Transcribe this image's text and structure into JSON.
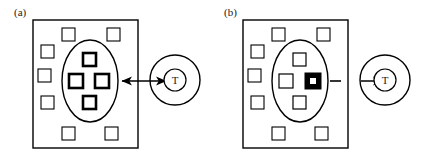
{
  "figure": {
    "type": "schematic-diagram",
    "background_color": "#ffffff",
    "stroke_color": "#000000",
    "fill_color": "#000000",
    "width": 432,
    "height": 163,
    "panels": [
      {
        "id": "a",
        "label": "(a)",
        "label_x": 14,
        "label_y": 16,
        "container": {
          "shape": "rectangle",
          "x": 33,
          "y": 20,
          "width": 105,
          "height": 128,
          "stroke_width": 1.4
        },
        "ellipse": {
          "shape": "ellipse",
          "cx": 90,
          "cy": 81,
          "rx": 28,
          "ry": 41,
          "stroke_width": 1.4
        },
        "outer_squares": [
          {
            "x": 62,
            "y": 28,
            "size": 13
          },
          {
            "x": 107,
            "y": 28,
            "size": 13
          },
          {
            "x": 41,
            "y": 45,
            "size": 13
          },
          {
            "x": 38,
            "y": 69,
            "size": 13
          },
          {
            "x": 41,
            "y": 96,
            "size": 13
          },
          {
            "x": 62,
            "y": 127,
            "size": 13
          },
          {
            "x": 105,
            "y": 127,
            "size": 13
          }
        ],
        "inner_squares": [
          {
            "x": 83,
            "y": 53,
            "size": 13,
            "style": "bold",
            "id": "top"
          },
          {
            "x": 69,
            "y": 74,
            "size": 14,
            "style": "bold",
            "id": "left"
          },
          {
            "x": 95,
            "y": 74,
            "size": 14,
            "style": "bold",
            "id": "right"
          },
          {
            "x": 83,
            "y": 96,
            "size": 13,
            "style": "bold",
            "id": "bottom"
          }
        ],
        "connector": {
          "style": "double-headed-arrow",
          "x1": 120,
          "x2": 168,
          "y": 81
        },
        "node": {
          "shape": "double-circle",
          "cx": 175,
          "cy": 80,
          "outer_r": 25,
          "inner_r": 11,
          "label": "T"
        }
      },
      {
        "id": "b",
        "label": "(b)",
        "label_x": 224,
        "label_y": 16,
        "container": {
          "shape": "rectangle",
          "x": 243,
          "y": 20,
          "width": 105,
          "height": 128,
          "stroke_width": 1.4
        },
        "ellipse": {
          "shape": "ellipse",
          "cx": 300,
          "cy": 81,
          "rx": 28,
          "ry": 41,
          "stroke_width": 1.4
        },
        "outer_squares": [
          {
            "x": 272,
            "y": 28,
            "size": 13
          },
          {
            "x": 317,
            "y": 28,
            "size": 13
          },
          {
            "x": 251,
            "y": 45,
            "size": 13
          },
          {
            "x": 248,
            "y": 69,
            "size": 13
          },
          {
            "x": 251,
            "y": 96,
            "size": 13
          },
          {
            "x": 272,
            "y": 127,
            "size": 13
          },
          {
            "x": 315,
            "y": 127,
            "size": 13
          }
        ],
        "inner_squares": [
          {
            "x": 293,
            "y": 53,
            "size": 13,
            "style": "thin",
            "id": "top"
          },
          {
            "x": 279,
            "y": 74,
            "size": 14,
            "style": "thin",
            "id": "left"
          },
          {
            "x": 293,
            "y": 96,
            "size": 13,
            "style": "thin",
            "id": "bottom"
          }
        ],
        "highlighted_square": {
          "x": 305,
          "y": 73,
          "size": 16,
          "style": "filled",
          "inner_size": 6,
          "inner_color": "#ffffff",
          "id": "selected"
        },
        "connector": {
          "style": "dashed-segment-plus-arrow",
          "dash_x1": 330,
          "dash_x2": 340,
          "y": 81,
          "arrow_x1": 363,
          "arrow_x2": 385
        },
        "node": {
          "shape": "double-circle",
          "cx": 385,
          "cy": 80,
          "outer_r": 25,
          "inner_r": 11,
          "label": "T"
        }
      }
    ]
  }
}
